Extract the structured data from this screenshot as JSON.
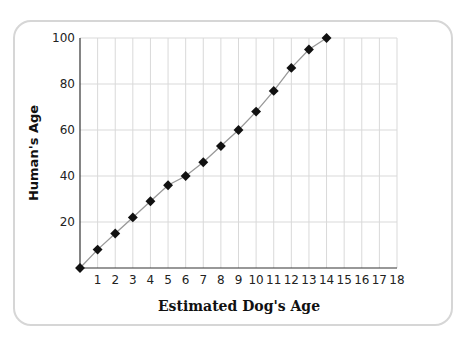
{
  "chart_data": {
    "type": "line",
    "title": "",
    "xlabel": "Estimated Dog's Age",
    "ylabel": "Human's Age",
    "x": [
      0,
      1,
      2,
      3,
      4,
      5,
      6,
      7,
      8,
      9,
      10,
      11,
      12,
      13,
      14
    ],
    "series": [
      {
        "name": "Human's Age",
        "values": [
          0,
          8,
          15,
          22,
          29,
          36,
          40,
          46,
          53,
          60,
          68,
          77,
          87,
          95,
          100
        ]
      }
    ],
    "xticks": [
      "1",
      "2",
      "3",
      "4",
      "5",
      "6",
      "7",
      "8",
      "9",
      "10",
      "11",
      "12",
      "13",
      "14",
      "15",
      "16",
      "17",
      "18"
    ],
    "yticks": [
      "20",
      "40",
      "60",
      "80",
      "100"
    ],
    "xlim": [
      0,
      18
    ],
    "ylim": [
      0,
      100
    ],
    "grid": true,
    "marker": "diamond",
    "line_color": "#999999",
    "marker_color": "#111111"
  }
}
